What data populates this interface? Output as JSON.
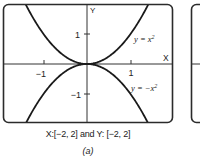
{
  "chart_data": {
    "type": "line",
    "title": "",
    "panel_label": "(a)",
    "xlabel": "X",
    "ylabel": "Y",
    "xlim": [
      -2,
      2
    ],
    "ylim": [
      -2,
      2
    ],
    "x_ticks": [
      -1,
      1
    ],
    "y_ticks": [
      1,
      -1
    ],
    "x_tick_labels": [
      "−1",
      "1"
    ],
    "y_tick_labels": [
      "1",
      "−1"
    ],
    "grid": false,
    "legend": "inline annotations",
    "series": [
      {
        "name": "y = x²",
        "equation": "y = x^2",
        "x": [
          -2,
          -1.5,
          -1.414,
          -1,
          -0.5,
          0,
          0.5,
          1,
          1.414,
          1.5,
          2
        ],
        "values": [
          4,
          2.25,
          2,
          1,
          0.25,
          0,
          0.25,
          1,
          2,
          2.25,
          4
        ]
      },
      {
        "name": "y = −x²",
        "equation": "y = -x^2",
        "x": [
          -2,
          -1.5,
          -1.414,
          -1,
          -0.5,
          0,
          0.5,
          1,
          1.414,
          1.5,
          2
        ],
        "values": [
          -4,
          -2.25,
          -2,
          -1,
          -0.25,
          0,
          -0.25,
          -1,
          -2,
          -2.25,
          -4
        ]
      }
    ],
    "window_caption": "X:[−2, 2] and Y: [−2, 2]"
  },
  "labels": {
    "axis_x": "X",
    "axis_y": "Y",
    "tick_x_neg1": "−1",
    "tick_x_pos1": "1",
    "tick_y_pos1": "1",
    "tick_y_neg1": "−1",
    "curve_upper": "y = x",
    "curve_lower": "y = −x",
    "exponent": "2"
  },
  "caption": {
    "window": "X:[−2, 2] and Y: [−2, 2]",
    "panel": "(a)"
  }
}
